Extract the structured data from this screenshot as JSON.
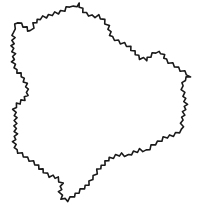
{
  "figure": {
    "width": 206,
    "height": 208,
    "background": "#ffffff",
    "stroke_color": "#1a1a1a",
    "stroke_width": 1.6,
    "wiggle_amplitude": 1.6,
    "wiggle_step": 3.2,
    "outline": [
      [
        14,
        28
      ],
      [
        18,
        22
      ],
      [
        24,
        26
      ],
      [
        28,
        30
      ],
      [
        31,
        31
      ],
      [
        34,
        24
      ],
      [
        40,
        18
      ],
      [
        46,
        17
      ],
      [
        52,
        14
      ],
      [
        58,
        13
      ],
      [
        64,
        10
      ],
      [
        70,
        6
      ],
      [
        74,
        7
      ],
      [
        78,
        4
      ],
      [
        82,
        9
      ],
      [
        86,
        14
      ],
      [
        92,
        16
      ],
      [
        98,
        16
      ],
      [
        104,
        20
      ],
      [
        108,
        26
      ],
      [
        112,
        38
      ],
      [
        118,
        41
      ],
      [
        124,
        44
      ],
      [
        130,
        47
      ],
      [
        134,
        52
      ],
      [
        140,
        58
      ],
      [
        146,
        60
      ],
      [
        150,
        56
      ],
      [
        156,
        52
      ],
      [
        162,
        53
      ],
      [
        166,
        60
      ],
      [
        172,
        64
      ],
      [
        178,
        68
      ],
      [
        184,
        72
      ],
      [
        190,
        76
      ],
      [
        184,
        80
      ],
      [
        182,
        86
      ],
      [
        184,
        96
      ],
      [
        186,
        104
      ],
      [
        184,
        112
      ],
      [
        182,
        120
      ],
      [
        182,
        130
      ],
      [
        176,
        134
      ],
      [
        170,
        136
      ],
      [
        164,
        138
      ],
      [
        158,
        142
      ],
      [
        152,
        146
      ],
      [
        146,
        151
      ],
      [
        140,
        150
      ],
      [
        134,
        152
      ],
      [
        128,
        156
      ],
      [
        122,
        154
      ],
      [
        116,
        156
      ],
      [
        110,
        158
      ],
      [
        106,
        162
      ],
      [
        102,
        166
      ],
      [
        98,
        170
      ],
      [
        94,
        176
      ],
      [
        90,
        182
      ],
      [
        84,
        188
      ],
      [
        78,
        192
      ],
      [
        74,
        196
      ],
      [
        68,
        200
      ],
      [
        62,
        199
      ],
      [
        60,
        192
      ],
      [
        62,
        184
      ],
      [
        58,
        178
      ],
      [
        50,
        176
      ],
      [
        44,
        172
      ],
      [
        38,
        166
      ],
      [
        30,
        160
      ],
      [
        24,
        156
      ],
      [
        16,
        150
      ],
      [
        14,
        142
      ],
      [
        16,
        134
      ],
      [
        15,
        126
      ],
      [
        16,
        118
      ],
      [
        14,
        110
      ],
      [
        17,
        104
      ],
      [
        24,
        100
      ],
      [
        28,
        92
      ],
      [
        26,
        84
      ],
      [
        22,
        76
      ],
      [
        16,
        70
      ],
      [
        13,
        62
      ],
      [
        14,
        54
      ],
      [
        12,
        46
      ],
      [
        14,
        38
      ],
      [
        12,
        32
      ]
    ]
  }
}
